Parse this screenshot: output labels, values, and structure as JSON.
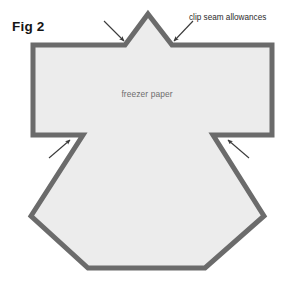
{
  "figure": {
    "number_label": "Fig 2",
    "callout_label": "clip seam allowances",
    "material_label": "freezer paper"
  },
  "colors": {
    "background": "#ffffff",
    "paper_fill": "#ececec",
    "seam_stroke": "#6b6b6b",
    "arrow": "#3a3a3a",
    "fig_text": "#151515",
    "callout_text": "#2b2b2b",
    "material_text": "#6e6e6e"
  },
  "geometry": {
    "outline_points": "148,14 172,45 272,45 272,135 213,135 264,216 205,268 88,268 31,216 83,135 33,135 33,45 125,45",
    "stroke_width": 5,
    "arrows": [
      {
        "name": "arrow-clip-left-notch",
        "x1": 104,
        "y1": 21,
        "x2": 124,
        "y2": 41
      },
      {
        "name": "arrow-clip-right-notch",
        "x1": 193,
        "y1": 21,
        "x2": 174,
        "y2": 41
      },
      {
        "name": "arrow-clip-left-underarm",
        "x1": 49,
        "y1": 158,
        "x2": 70,
        "y2": 140
      },
      {
        "name": "arrow-clip-right-underarm",
        "x1": 249,
        "y1": 158,
        "x2": 228,
        "y2": 140
      }
    ]
  }
}
